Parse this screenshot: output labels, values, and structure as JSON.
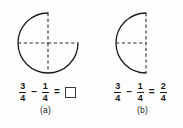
{
  "figure": {
    "panels": [
      {
        "id": "a",
        "label": "(a)",
        "diagram": {
          "name": "three-quarter-circle",
          "description": "Circle with the upper-right quadrant removed, dashed radius lines marking quarters",
          "shape": "circle-minus-quadrant",
          "missing_quadrant": "upper-right",
          "center_x": 48,
          "center_y": 43,
          "radius": 30,
          "stroke_color": "#1c1c1c",
          "dash_color": "#2a2a2a"
        },
        "equation": {
          "left_fraction": {
            "numerator": "3",
            "denominator": "4"
          },
          "operator_1": "–",
          "right_fraction": {
            "numerator": "1",
            "denominator": "4"
          },
          "operator_2": "=",
          "result_kind": "empty-box",
          "result_fraction": {
            "numerator": "",
            "denominator": ""
          }
        }
      },
      {
        "id": "b",
        "label": "(b)",
        "diagram": {
          "name": "half-circle",
          "description": "Left half circle (semicircle) with dashed vertical diameter and dashed horizontal radius",
          "shape": "semicircle-left",
          "center_x": 55,
          "center_y": 43,
          "radius": 30,
          "stroke_color": "#1c1c1c",
          "dash_color": "#2a2a2a"
        },
        "equation": {
          "left_fraction": {
            "numerator": "3",
            "denominator": "4"
          },
          "operator_1": "–",
          "right_fraction": {
            "numerator": "1",
            "denominator": "4"
          },
          "operator_2": "=",
          "result_kind": "fraction",
          "result_fraction": {
            "numerator": "2",
            "denominator": "4"
          }
        }
      }
    ],
    "colors": {
      "background": "#fdfdfc",
      "ink": "#1c1c1c",
      "dash": "#2a2a2a"
    }
  }
}
